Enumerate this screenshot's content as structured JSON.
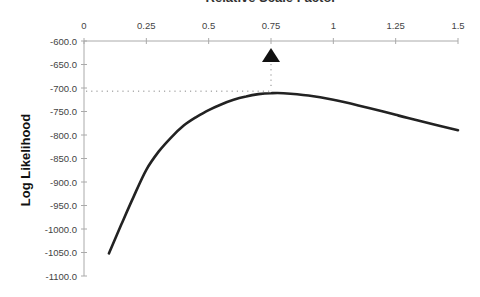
{
  "chart_data": {
    "type": "line",
    "title": "Relative Scale Factor",
    "xlabel": "Relative Scale Factor",
    "ylabel": "Log Likelihood",
    "xlim": [
      0,
      1.5
    ],
    "ylim": [
      -1100,
      -600
    ],
    "x_ticks": [
      0,
      0.25,
      0.5,
      0.75,
      1,
      1.25,
      1.5
    ],
    "x_tick_labels": [
      "0",
      "0.25",
      "0.5",
      "0.75",
      "1",
      "1.25",
      "1.5"
    ],
    "y_ticks": [
      -600,
      -650,
      -700,
      -750,
      -800,
      -850,
      -900,
      -950,
      -1000,
      -1050,
      -1100
    ],
    "y_tick_labels": [
      "-600.0",
      "-650.0",
      "-700.0",
      "-750.0",
      "-800.0",
      "-850.0",
      "-900.0",
      "-950.0",
      "-1000.0",
      "-1050.0",
      "-1100.0"
    ],
    "x_axis_position": "top",
    "grid": false,
    "legend": null,
    "series": [
      {
        "name": "Log Likelihood",
        "x": [
          0.1,
          0.15,
          0.2,
          0.25,
          0.3,
          0.35,
          0.4,
          0.45,
          0.5,
          0.55,
          0.6,
          0.65,
          0.7,
          0.75,
          0.8,
          0.9,
          1.0,
          1.1,
          1.2,
          1.25,
          1.3,
          1.4,
          1.5
        ],
        "y": [
          -1052,
          -990,
          -930,
          -874,
          -835,
          -805,
          -780,
          -762,
          -747,
          -735,
          -725,
          -718,
          -713,
          -711,
          -711,
          -716,
          -725,
          -737,
          -750,
          -757,
          -764,
          -777,
          -790
        ],
        "color": "#222222"
      }
    ],
    "annotations": [
      {
        "type": "marker",
        "shape": "triangle-up",
        "x": 0.75,
        "label": "maximum likelihood",
        "color": "#111111"
      },
      {
        "type": "dotted-guide",
        "from_x": 0,
        "to_x": 0.75,
        "y": -711
      }
    ]
  }
}
